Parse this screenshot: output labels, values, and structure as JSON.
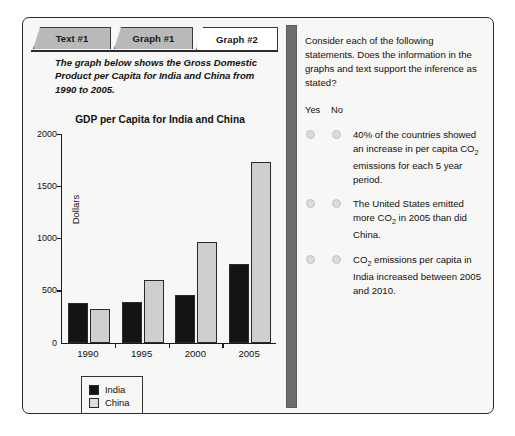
{
  "tabs": [
    {
      "label": "Text #1",
      "active": false
    },
    {
      "label": "Graph #1",
      "active": false
    },
    {
      "label": "Graph #2",
      "active": true
    }
  ],
  "left_pane": {
    "intro_text": "The graph below shows the Gross Domestic Product per Capita for India and China from 1990 to 2005."
  },
  "chart_data": {
    "type": "bar",
    "title": "GDP per Capita for India and China",
    "xlabel": "",
    "ylabel": "Dollars",
    "categories": [
      "1990",
      "1995",
      "2000",
      "2005"
    ],
    "series": [
      {
        "name": "India",
        "color": "#141414",
        "values": [
          380,
          385,
          455,
          755
        ]
      },
      {
        "name": "China",
        "color": "#cfcfcf",
        "values": [
          320,
          600,
          960,
          1730
        ]
      }
    ],
    "ylim": [
      0,
      2000
    ],
    "yticks": [
      0,
      500,
      1000,
      1500,
      2000
    ],
    "ytick_labels": [
      "0",
      "500",
      "1000",
      "1500",
      "2000"
    ],
    "grid": false,
    "legend_position": "below-left"
  },
  "right_pane": {
    "prompt": "Consider each of the following statements. Does the information in the graphs and text support the inference as stated?",
    "yes_label": "Yes",
    "no_label": "No",
    "statements": [
      {
        "id": "statement-1",
        "parts": [
          {
            "type": "text",
            "value": "40% of the countries showed an increase in per capita CO"
          },
          {
            "type": "sub",
            "value": "2"
          },
          {
            "type": "text",
            "value": " emissions for each 5 year period."
          }
        ],
        "selected": ""
      },
      {
        "id": "statement-2",
        "parts": [
          {
            "type": "text",
            "value": "The United States emitted more CO"
          },
          {
            "type": "sub",
            "value": "2"
          },
          {
            "type": "text",
            "value": " in 2005 than did China."
          }
        ],
        "selected": ""
      },
      {
        "id": "statement-3",
        "parts": [
          {
            "type": "text",
            "value": "CO"
          },
          {
            "type": "sub",
            "value": "2"
          },
          {
            "type": "text",
            "value": " emissions per capita in India increased between 2005 and 2010."
          }
        ],
        "selected": ""
      }
    ]
  },
  "colors": {
    "frame_border": "#2b2b2b",
    "panel_background": "#f7f7f5",
    "tab_inactive": "#b9b9b9",
    "tab_active": "#ffffff",
    "divider": "#6d6d6d",
    "radio_fill": "#dcdcdc"
  }
}
